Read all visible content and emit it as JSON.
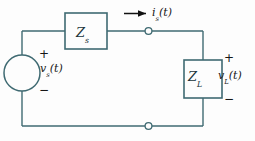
{
  "diagram": {
    "colors": {
      "wire": "#3f6a72",
      "component_border": "#3f6a72",
      "component_fill": "#fdfdfd",
      "text": "#161616",
      "box_label": "#20343a",
      "arrow": "#111111",
      "background": "#fdfdfd"
    },
    "components": {
      "source_impedance": {
        "label_main": "Z",
        "label_sub": "s",
        "name": "series source impedance"
      },
      "load_impedance": {
        "label_main": "Z",
        "label_sub": "L",
        "name": "load impedance"
      },
      "voltage_source": {
        "label_main": "v",
        "label_sub": "s",
        "label_suffix": "(t)",
        "plus": "+",
        "minus": "−",
        "name": "ac voltage source"
      },
      "load_voltage": {
        "label_main": "v",
        "label_sub": "L",
        "label_suffix": "(t)",
        "plus": "+",
        "minus": "−",
        "name": "load voltage"
      },
      "current": {
        "label_main": "i",
        "label_sub": "s",
        "label_suffix": "(t)",
        "direction": "right",
        "name": "source current"
      },
      "terminals": [
        {
          "name": "top-terminal",
          "shape": "open-circle"
        },
        {
          "name": "bottom-terminal",
          "shape": "open-circle"
        }
      ]
    }
  }
}
